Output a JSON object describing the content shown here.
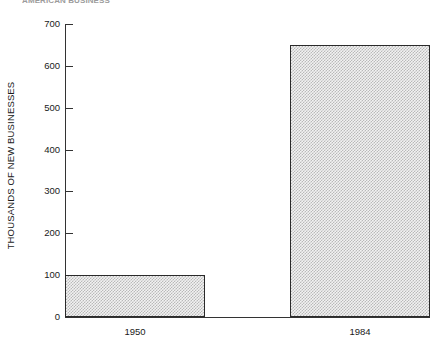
{
  "caption": {
    "text": "AMERICAN BUSINESS"
  },
  "chart_data": {
    "type": "bar",
    "title": "",
    "xlabel": "",
    "ylabel": "THOUSANDS OF NEW BUSINESSES",
    "categories": [
      "1950",
      "1984"
    ],
    "values": [
      100,
      650
    ],
    "ylim": [
      0,
      700
    ],
    "yticks": [
      0,
      100,
      200,
      300,
      400,
      500,
      600,
      700
    ],
    "ytick_labels": [
      "0",
      "100",
      "200",
      "300",
      "400",
      "500",
      "600",
      "700"
    ],
    "grid": false,
    "legend": null,
    "bar_fill": "#c9c9c9",
    "bar_edge": "#2a2a2a",
    "background": "#ffffff"
  }
}
